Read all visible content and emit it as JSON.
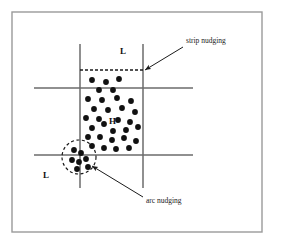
{
  "figure": {
    "type": "diagram",
    "title": "",
    "background_color": "#ffffff",
    "frame": {
      "name": "outer-border",
      "x": 12,
      "y": 12,
      "width": 250,
      "height": 220,
      "stroke": "#9a9a9a",
      "stroke_width": 1.4
    },
    "grid": {
      "line_color": "#6b6b6b",
      "line_width": 1.5,
      "vertical_lines": [
        {
          "name": "vertical-line-left",
          "x": 80,
          "y1": 44,
          "y2": 188
        },
        {
          "name": "vertical-line-right",
          "x": 143,
          "y1": 44,
          "y2": 188
        }
      ],
      "horizontal_lines": [
        {
          "name": "horizontal-line-upper",
          "y": 88,
          "x1": 34,
          "x2": 193
        },
        {
          "name": "horizontal-line-lower",
          "y": 155,
          "x1": 34,
          "x2": 193
        }
      ]
    },
    "dashed_strip_line": {
      "name": "strip-nudging-dashed-line",
      "y": 70,
      "x1": 80,
      "x2": 143,
      "stroke": "#1a1a1a",
      "stroke_width": 1.3,
      "dash_pattern": "3 2"
    },
    "dashed_circle": {
      "name": "arc-nudging-dashed-circle",
      "cx": 79,
      "cy": 157,
      "r": 17,
      "stroke": "#1a1a1a",
      "stroke_width": 1.2,
      "dash_pattern": "3 2.5"
    },
    "labels": [
      {
        "name": "label-L-top",
        "text": "L",
        "x": 120,
        "y": 54,
        "font_size": 9
      },
      {
        "name": "label-H-center",
        "text": "H",
        "x": 109,
        "y": 124,
        "font_size": 9
      },
      {
        "name": "label-L-bottomleft",
        "text": "L",
        "x": 43,
        "y": 178,
        "font_size": 9
      }
    ],
    "annotations": [
      {
        "name": "strip-nudging-annotation",
        "text": "strip nudging",
        "text_x": 186,
        "text_y": 43,
        "font_size": 7.5,
        "arrow": {
          "name": "strip-nudging-arrow",
          "x1": 183,
          "y1": 47,
          "x2": 145,
          "y2": 70,
          "stroke": "#1a1a1a",
          "stroke_width": 1.0
        }
      },
      {
        "name": "arc-nudging-annotation",
        "text": "arc nudging",
        "text_x": 146,
        "text_y": 203,
        "font_size": 7.5,
        "arrow": {
          "name": "arc-nudging-arrow",
          "x1": 143,
          "y1": 197,
          "x2": 92,
          "y2": 166,
          "stroke": "#1a1a1a",
          "stroke_width": 1.0
        }
      }
    ],
    "dot_style": {
      "fill": "#111111",
      "radius": 2.9
    },
    "dots": [
      {
        "x": 92,
        "y": 80
      },
      {
        "x": 106,
        "y": 82
      },
      {
        "x": 119,
        "y": 79
      },
      {
        "x": 99,
        "y": 90
      },
      {
        "x": 113,
        "y": 90
      },
      {
        "x": 88,
        "y": 99
      },
      {
        "x": 102,
        "y": 100
      },
      {
        "x": 117,
        "y": 98
      },
      {
        "x": 131,
        "y": 101
      },
      {
        "x": 94,
        "y": 109
      },
      {
        "x": 108,
        "y": 110
      },
      {
        "x": 122,
        "y": 108
      },
      {
        "x": 135,
        "y": 112
      },
      {
        "x": 86,
        "y": 118
      },
      {
        "x": 99,
        "y": 119
      },
      {
        "x": 118,
        "y": 120
      },
      {
        "x": 130,
        "y": 122
      },
      {
        "x": 92,
        "y": 128
      },
      {
        "x": 104,
        "y": 124
      },
      {
        "x": 113,
        "y": 131
      },
      {
        "x": 126,
        "y": 130
      },
      {
        "x": 138,
        "y": 127
      },
      {
        "x": 88,
        "y": 137
      },
      {
        "x": 100,
        "y": 137
      },
      {
        "x": 112,
        "y": 140
      },
      {
        "x": 124,
        "y": 138
      },
      {
        "x": 136,
        "y": 141
      },
      {
        "x": 92,
        "y": 146
      },
      {
        "x": 104,
        "y": 148
      },
      {
        "x": 116,
        "y": 149
      },
      {
        "x": 129,
        "y": 148
      },
      {
        "x": 74,
        "y": 150
      },
      {
        "x": 81,
        "y": 153
      },
      {
        "x": 72,
        "y": 160
      },
      {
        "x": 79,
        "y": 162
      },
      {
        "x": 86,
        "y": 159
      },
      {
        "x": 77,
        "y": 169
      },
      {
        "x": 88,
        "y": 167
      }
    ]
  }
}
